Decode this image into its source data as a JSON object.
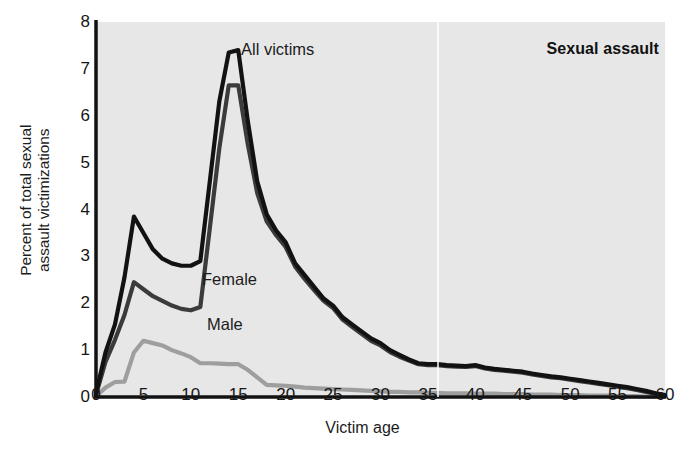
{
  "chart_data": {
    "type": "line",
    "title": "Sexual assault",
    "xlabel": "Victim age",
    "ylabel": "Percent of total sexual assault victimizations",
    "ylabel_line1": "Percent of total sexual",
    "ylabel_line2": "assault victimizations",
    "xlim": [
      0,
      60
    ],
    "ylim": [
      0,
      8
    ],
    "xticks": [
      0,
      5,
      10,
      15,
      20,
      25,
      30,
      35,
      40,
      45,
      50,
      55,
      60
    ],
    "yticks": [
      0,
      1,
      2,
      3,
      4,
      5,
      6,
      7,
      8
    ],
    "grid": false,
    "legend_position": "inline-annotations",
    "plot_background": "#e7e7e7",
    "x": [
      0,
      1,
      2,
      3,
      4,
      5,
      6,
      7,
      8,
      9,
      10,
      11,
      12,
      13,
      14,
      15,
      16,
      17,
      18,
      19,
      20,
      21,
      22,
      23,
      24,
      25,
      26,
      27,
      28,
      29,
      30,
      31,
      32,
      33,
      34,
      35,
      36,
      37,
      38,
      39,
      40,
      41,
      42,
      43,
      44,
      45,
      46,
      47,
      48,
      49,
      50,
      51,
      52,
      53,
      54,
      55,
      56,
      57,
      58,
      59,
      60
    ],
    "series": [
      {
        "name": "All victims",
        "color": "#121212",
        "width": 4.2,
        "values": [
          0.08,
          0.95,
          1.55,
          2.55,
          3.85,
          3.5,
          3.15,
          2.95,
          2.85,
          2.8,
          2.8,
          2.9,
          4.6,
          6.3,
          7.35,
          7.4,
          5.9,
          4.6,
          3.9,
          3.55,
          3.3,
          2.85,
          2.6,
          2.35,
          2.1,
          1.95,
          1.7,
          1.55,
          1.4,
          1.25,
          1.15,
          1.0,
          0.9,
          0.8,
          0.72,
          0.7,
          0.7,
          0.68,
          0.67,
          0.66,
          0.68,
          0.63,
          0.6,
          0.58,
          0.56,
          0.54,
          0.5,
          0.47,
          0.44,
          0.42,
          0.39,
          0.36,
          0.33,
          0.3,
          0.27,
          0.24,
          0.21,
          0.17,
          0.13,
          0.08,
          0.04
        ]
      },
      {
        "name": "Female",
        "color": "#3b3b3b",
        "width": 4.2,
        "values": [
          0.05,
          0.75,
          1.22,
          1.75,
          2.45,
          2.3,
          2.15,
          2.05,
          1.95,
          1.88,
          1.85,
          1.92,
          3.6,
          5.3,
          6.65,
          6.65,
          5.4,
          4.35,
          3.75,
          3.45,
          3.2,
          2.78,
          2.52,
          2.28,
          2.05,
          1.9,
          1.65,
          1.5,
          1.35,
          1.2,
          1.1,
          0.96,
          0.86,
          0.78,
          0.7,
          0.68,
          0.68,
          0.66,
          0.65,
          0.64,
          0.66,
          0.61,
          0.58,
          0.56,
          0.54,
          0.52,
          0.48,
          0.45,
          0.42,
          0.4,
          0.37,
          0.34,
          0.31,
          0.28,
          0.25,
          0.22,
          0.19,
          0.15,
          0.11,
          0.07,
          0.03
        ]
      },
      {
        "name": "Male",
        "color": "#9e9e9e",
        "width": 4.2,
        "values": [
          0.02,
          0.2,
          0.32,
          0.33,
          0.95,
          1.2,
          1.15,
          1.1,
          1.0,
          0.93,
          0.85,
          0.72,
          0.72,
          0.71,
          0.7,
          0.7,
          0.58,
          0.42,
          0.26,
          0.25,
          0.24,
          0.22,
          0.2,
          0.19,
          0.18,
          0.17,
          0.16,
          0.15,
          0.14,
          0.13,
          0.12,
          0.11,
          0.11,
          0.1,
          0.1,
          0.09,
          0.09,
          0.08,
          0.08,
          0.08,
          0.07,
          0.07,
          0.07,
          0.06,
          0.06,
          0.06,
          0.05,
          0.05,
          0.05,
          0.04,
          0.04,
          0.04,
          0.03,
          0.03,
          0.03,
          0.02,
          0.02,
          0.02,
          0.01,
          0.01,
          0.01
        ]
      }
    ],
    "annotations": [
      {
        "text": "All victims",
        "series": "All victims"
      },
      {
        "text": "Female",
        "series": "Female"
      },
      {
        "text": "Male",
        "series": "Male"
      }
    ]
  }
}
